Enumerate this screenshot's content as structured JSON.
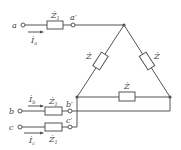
{
  "diagram": {
    "type": "three-phase circuit: line impedances feeding delta-connected load",
    "colors": {
      "line": "#555555",
      "text": "#444444",
      "background": "#ffffff"
    },
    "terminals": [
      {
        "id": "a",
        "label": "a"
      },
      {
        "id": "b",
        "label": "b"
      },
      {
        "id": "c",
        "label": "c"
      },
      {
        "id": "a_prime",
        "label": "a′"
      },
      {
        "id": "b_prime",
        "label": "b′"
      },
      {
        "id": "c_prime",
        "label": "c′"
      }
    ],
    "line_impedances": [
      {
        "phase": "a",
        "label": "Ż",
        "sub": "1"
      },
      {
        "phase": "b",
        "label": "Ż",
        "sub": "1"
      },
      {
        "phase": "c",
        "label": "Ż",
        "sub": "1"
      }
    ],
    "currents": [
      {
        "phase": "a",
        "label": "İ",
        "sub": "a"
      },
      {
        "phase": "b",
        "label": "İ",
        "sub": "b"
      },
      {
        "phase": "c",
        "label": "İ",
        "sub": "c"
      }
    ],
    "delta_impedances": [
      {
        "branch": "left",
        "label": "Ż"
      },
      {
        "branch": "right",
        "label": "Ż"
      },
      {
        "branch": "bottom",
        "label": "Ż"
      }
    ]
  }
}
